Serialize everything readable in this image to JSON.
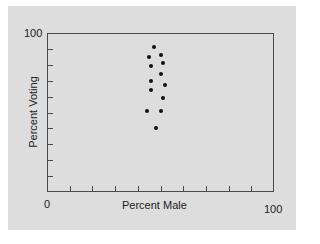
{
  "chart_data": {
    "type": "scatter",
    "title": "",
    "xlabel": "Percent Male",
    "ylabel": "Percent Voting",
    "xlim": [
      0,
      100
    ],
    "ylim": [
      0,
      100
    ],
    "x_tick_labels": [
      "0",
      "100"
    ],
    "y_tick_labels": [
      "0",
      "100"
    ],
    "grid": false,
    "legend": null,
    "points": [
      {
        "x": 47,
        "y": 91
      },
      {
        "x": 45,
        "y": 85
      },
      {
        "x": 50,
        "y": 86
      },
      {
        "x": 51,
        "y": 81
      },
      {
        "x": 46,
        "y": 79
      },
      {
        "x": 50,
        "y": 74
      },
      {
        "x": 46,
        "y": 70
      },
      {
        "x": 52,
        "y": 67
      },
      {
        "x": 46,
        "y": 64
      },
      {
        "x": 51,
        "y": 59
      },
      {
        "x": 44,
        "y": 51
      },
      {
        "x": 50,
        "y": 51
      },
      {
        "x": 48,
        "y": 40
      }
    ]
  },
  "axes": {
    "x_min_label": "0",
    "x_max_label": "100",
    "y_max_label": "100",
    "x_title": "Percent Male",
    "y_title": "Percent Voting"
  }
}
